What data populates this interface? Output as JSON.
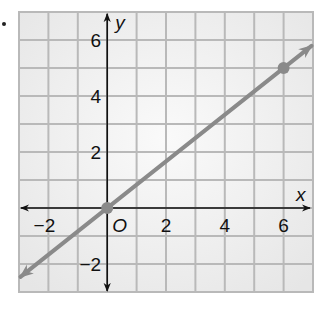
{
  "chart_data": {
    "type": "line",
    "title": "",
    "xlabel": "x",
    "ylabel": "y",
    "origin_label": "O",
    "xlim": [
      -3,
      7
    ],
    "ylim": [
      -3,
      7
    ],
    "grid": true,
    "x_ticks": [
      -2,
      2,
      4,
      6
    ],
    "y_ticks": [
      -2,
      2,
      4,
      6
    ],
    "x_tick_labels": [
      "−2",
      "2",
      "4",
      "6"
    ],
    "y_tick_labels": [
      "−2",
      "2",
      "4",
      "6"
    ],
    "series": [
      {
        "name": "line",
        "equation": "y = (5/6)x",
        "slope": 0.8333,
        "intercept": 0,
        "points": [
          {
            "x": 0,
            "y": 0
          },
          {
            "x": 6,
            "y": 5
          }
        ],
        "arrows_both_ends": true,
        "color": "#8a8a8a"
      }
    ],
    "colors": {
      "grid": "#b9b9b9",
      "grid_background": "#efefef",
      "axes": "#111111",
      "line": "#8a8a8a"
    }
  }
}
